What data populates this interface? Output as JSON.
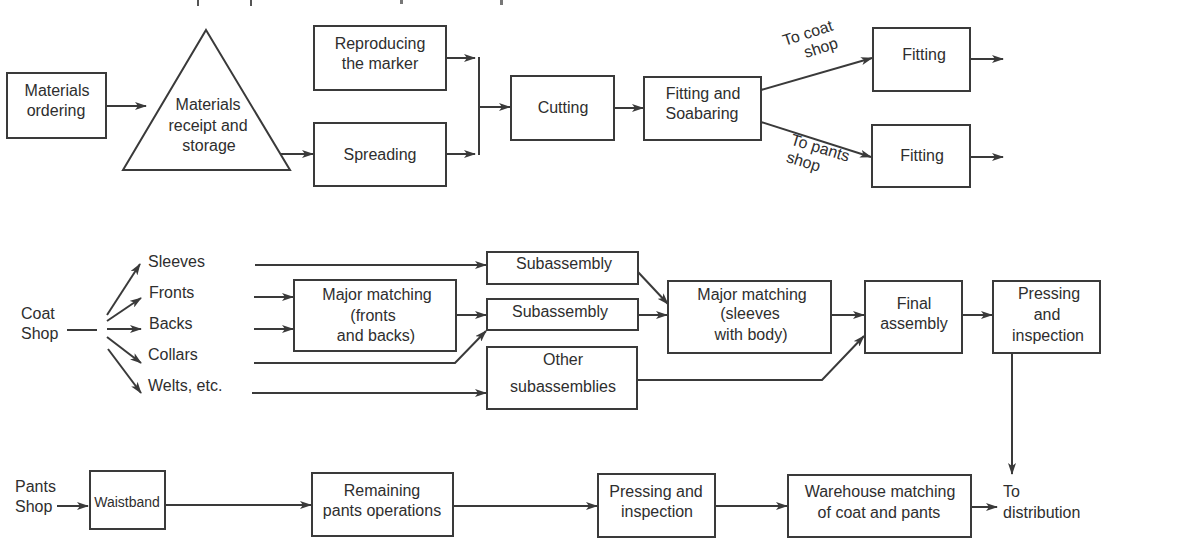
{
  "diagram": {
    "title_clipped": "",
    "section_production": {
      "materials_ordering": [
        "Materials",
        "ordering"
      ],
      "materials_receipt": [
        "Materials",
        "receipt and",
        "storage"
      ],
      "reproducing_marker": [
        "Reproducing",
        "the marker"
      ],
      "spreading": "Spreading",
      "cutting": "Cutting",
      "fitting_soabaring": [
        "Fitting and",
        "Soabaring"
      ],
      "to_coat_shop": [
        "To coat",
        "shop"
      ],
      "to_pants_shop": [
        "To pants",
        "shop"
      ],
      "fitting_top": "Fitting",
      "fitting_bottom": "Fitting"
    },
    "section_coat_shop": {
      "source": [
        "Coat",
        "Shop"
      ],
      "parts": [
        "Sleeves",
        "Fronts",
        "Backs",
        "Collars",
        "Welts, etc."
      ],
      "major_matching_fronts": [
        "Major matching",
        "(fronts",
        "and backs)"
      ],
      "subassembly_1": "Subassembly",
      "subassembly_2": "Subassembly",
      "other_subassemblies": [
        "Other",
        "subassemblies"
      ],
      "major_matching_sleeves": [
        "Major matching",
        "(sleeves",
        "with body)"
      ],
      "final_assembly": [
        "Final",
        "assembly"
      ],
      "pressing_inspection": [
        "Pressing",
        "and",
        "inspection"
      ]
    },
    "section_pants_shop": {
      "source": [
        "Pants",
        "Shop"
      ],
      "waistband": "Waistband",
      "remaining_ops": [
        "Remaining",
        "pants operations"
      ],
      "pressing_inspection": [
        "Pressing and",
        "inspection"
      ],
      "warehouse_matching": [
        "Warehouse matching",
        "of coat and pants"
      ],
      "to_distribution": [
        "To",
        "distribution"
      ]
    },
    "colors": {
      "stroke": "#3a3a3a",
      "text": "#2e2e2e",
      "background": "#ffffff"
    }
  }
}
